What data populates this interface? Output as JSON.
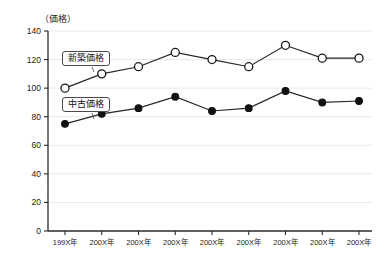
{
  "chart_data": {
    "type": "line",
    "title": "",
    "subtitle": "",
    "xlabel": "",
    "ylabel": "（価格）",
    "ylim": [
      0,
      140
    ],
    "yticks": [
      0,
      20,
      40,
      60,
      80,
      100,
      120,
      140
    ],
    "grid": true,
    "legend_position": "inside-plot-boxed-labels",
    "categories": [
      "199X年",
      "200X年",
      "200X年",
      "200X年",
      "200X年",
      "200X年",
      "200X年",
      "200X年",
      "200X年"
    ],
    "series": [
      {
        "name": "新築価格",
        "marker": "open-circle",
        "values": [
          100,
          110,
          115,
          125,
          120,
          115,
          130,
          121,
          121
        ]
      },
      {
        "name": "中古価格",
        "marker": "filled-circle",
        "values": [
          75,
          82,
          86,
          94,
          84,
          86,
          98,
          90,
          91
        ]
      }
    ]
  },
  "legend": {
    "shinchiku_label": "新築価格",
    "chuko_label": "中古価格"
  },
  "axis": {
    "unit_label": "（価格）"
  },
  "colors": {
    "line": "#262626",
    "grid": "#e2e2e2",
    "axis": "#2b2b2b",
    "marker_open_fill": "#ffffff",
    "marker_filled_fill": "#111111",
    "background": "#ffffff",
    "text": "#1a1a1a"
  }
}
